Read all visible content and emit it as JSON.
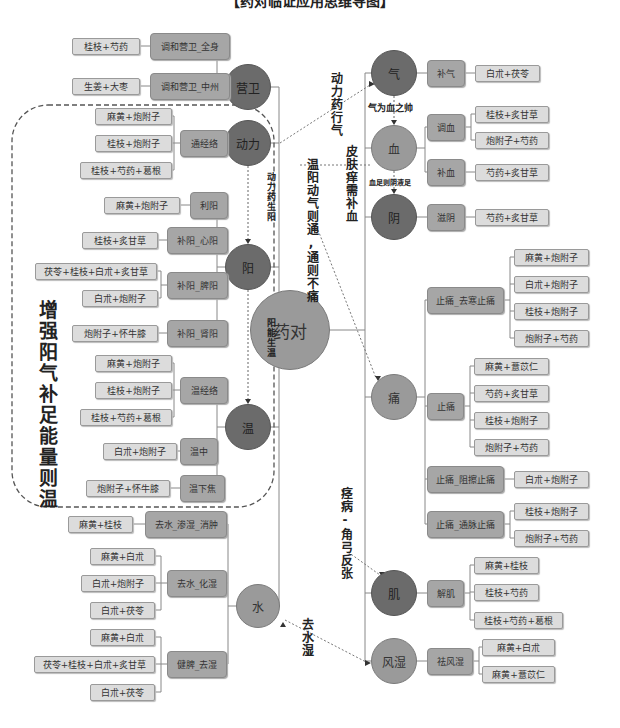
{
  "title": "【药对临证应用思维导图】",
  "center": {
    "label": "药对",
    "x": 290,
    "y": 330,
    "r": 40
  },
  "circles": [
    {
      "id": "yingwei",
      "label": "营卫",
      "x": 248,
      "y": 87,
      "r": 23,
      "tone": "dark"
    },
    {
      "id": "dongli",
      "label": "动力",
      "x": 248,
      "y": 143,
      "r": 23,
      "tone": "dark"
    },
    {
      "id": "yang",
      "label": "阳",
      "x": 248,
      "y": 267,
      "r": 23,
      "tone": "dark"
    },
    {
      "id": "wen",
      "label": "温",
      "x": 248,
      "y": 427,
      "r": 23,
      "tone": "dark"
    },
    {
      "id": "shui",
      "label": "水",
      "x": 258,
      "y": 606,
      "r": 22,
      "tone": "medium"
    },
    {
      "id": "qi",
      "label": "气",
      "x": 394,
      "y": 73,
      "r": 23,
      "tone": "dark"
    },
    {
      "id": "xue",
      "label": "血",
      "x": 394,
      "y": 148,
      "r": 23,
      "tone": "medium"
    },
    {
      "id": "yin",
      "label": "阴",
      "x": 394,
      "y": 217,
      "r": 23,
      "tone": "dark"
    },
    {
      "id": "tong",
      "label": "痛",
      "x": 394,
      "y": 397,
      "r": 23,
      "tone": "medium"
    },
    {
      "id": "ji",
      "label": "肌",
      "x": 394,
      "y": 593,
      "r": 23,
      "tone": "dark"
    },
    {
      "id": "fengshi",
      "label": "风湿",
      "x": 394,
      "y": 661,
      "r": 23,
      "tone": "medium"
    }
  ],
  "left_branches": [
    {
      "circle": "营卫",
      "mids": [
        {
          "label": "调和营卫_全身",
          "x": 150,
          "y": 46,
          "w": 80,
          "leaves": [
            {
              "label": "桂枝+芍药",
              "x": 72,
              "y": 46,
              "w": 68
            }
          ]
        },
        {
          "label": "调和营卫_中州",
          "x": 150,
          "y": 86,
          "w": 80,
          "leaves": [
            {
              "label": "生姜+大枣",
              "x": 72,
              "y": 86,
              "w": 68
            }
          ]
        }
      ]
    },
    {
      "circle": "动力",
      "mids": [
        {
          "label": "通经络",
          "x": 180,
          "y": 143,
          "w": 48,
          "leaves": [
            {
              "label": "麻黄+炮附子",
              "x": 95,
              "y": 116,
              "w": 77
            },
            {
              "label": "桂枝+炮附子",
              "x": 95,
              "y": 143,
              "w": 77
            },
            {
              "label": "桂枝+芍药+葛根",
              "x": 80,
              "y": 170,
              "w": 92
            }
          ]
        }
      ]
    },
    {
      "circle": "阳",
      "mids": [
        {
          "label": "利阳",
          "x": 190,
          "y": 205,
          "w": 38,
          "leaves": [
            {
              "label": "麻黄+炮附子",
              "x": 104,
              "y": 205,
              "w": 76
            }
          ]
        },
        {
          "label": "补阳_心阳",
          "x": 167,
          "y": 240,
          "w": 61,
          "leaves": [
            {
              "label": "桂枝+炙甘草",
              "x": 82,
              "y": 240,
              "w": 76
            }
          ]
        },
        {
          "label": "补阳_脾阳",
          "x": 167,
          "y": 285,
          "w": 61,
          "leaves": [
            {
              "label": "茯苓+桂枝+白朮+炙甘草",
              "x": 35,
              "y": 271,
              "w": 122
            },
            {
              "label": "白朮+炮附子",
              "x": 82,
              "y": 298,
              "w": 76
            }
          ]
        },
        {
          "label": "补阳_肾阳",
          "x": 167,
          "y": 333,
          "w": 61,
          "leaves": [
            {
              "label": "炮附子+怀牛膝",
              "x": 72,
              "y": 333,
              "w": 86
            }
          ]
        }
      ]
    },
    {
      "circle": "温",
      "mids": [
        {
          "label": "温经络",
          "x": 180,
          "y": 390,
          "w": 48,
          "leaves": [
            {
              "label": "麻黄+炮附子",
              "x": 95,
              "y": 363,
              "w": 77
            },
            {
              "label": "桂枝+炮附子",
              "x": 95,
              "y": 390,
              "w": 77
            },
            {
              "label": "桂枝+芍药+葛根",
              "x": 80,
              "y": 417,
              "w": 92
            }
          ]
        },
        {
          "label": "温中",
          "x": 180,
          "y": 451,
          "w": 38,
          "leaves": [
            {
              "label": "白朮+炮附子",
              "x": 103,
              "y": 451,
              "w": 74
            }
          ]
        },
        {
          "label": "温下焦",
          "x": 180,
          "y": 488,
          "w": 45,
          "leaves": [
            {
              "label": "炮附子+怀牛膝",
              "x": 86,
              "y": 488,
              "w": 84
            }
          ]
        }
      ]
    },
    {
      "circle": "水",
      "mids": [
        {
          "label": "去水_渗湿_消肿",
          "x": 145,
          "y": 524,
          "w": 82,
          "leaves": [
            {
              "label": "麻黄+桂枝",
              "x": 68,
              "y": 524,
              "w": 65
            }
          ]
        },
        {
          "label": "去水_化湿",
          "x": 167,
          "y": 583,
          "w": 60,
          "leaves": [
            {
              "label": "麻黄+白朮",
              "x": 90,
              "y": 556,
              "w": 65
            },
            {
              "label": "白朮+炮附子",
              "x": 81,
              "y": 583,
              "w": 74
            },
            {
              "label": "白朮+茯苓",
              "x": 90,
              "y": 610,
              "w": 65
            }
          ]
        },
        {
          "label": "健脾_去湿",
          "x": 167,
          "y": 664,
          "w": 60,
          "leaves": [
            {
              "label": "麻黄+白朮",
              "x": 90,
              "y": 637,
              "w": 65
            },
            {
              "label": "茯苓+桂枝+白朮+炙甘草",
              "x": 34,
              "y": 664,
              "w": 121
            },
            {
              "label": "白朮+茯苓",
              "x": 90,
              "y": 692,
              "w": 65
            }
          ]
        }
      ]
    }
  ],
  "right_branches": [
    {
      "circle": "气",
      "mids": [
        {
          "label": "补气",
          "x": 427,
          "y": 73,
          "w": 38,
          "leaves": [
            {
              "label": "白朮+茯苓",
              "x": 475,
              "y": 73,
              "w": 65
            }
          ]
        }
      ]
    },
    {
      "circle": "血",
      "mids": [
        {
          "label": "调血",
          "x": 427,
          "y": 127,
          "w": 38,
          "leaves": [
            {
              "label": "桂枝+炙甘草",
              "x": 475,
              "y": 114,
              "w": 74
            },
            {
              "label": "炮附子+芍药",
              "x": 475,
              "y": 140,
              "w": 74
            }
          ]
        },
        {
          "label": "补血",
          "x": 427,
          "y": 172,
          "w": 38,
          "leaves": [
            {
              "label": "芍药+炙甘草",
              "x": 475,
              "y": 172,
              "w": 74
            }
          ]
        }
      ]
    },
    {
      "circle": "阴",
      "mids": [
        {
          "label": "滋阴",
          "x": 427,
          "y": 217,
          "w": 38,
          "leaves": [
            {
              "label": "芍药+炙甘草",
              "x": 475,
              "y": 217,
              "w": 74
            }
          ]
        }
      ]
    },
    {
      "circle": "痛",
      "mids": [
        {
          "label": "止痛_去寒止痛",
          "x": 427,
          "y": 300,
          "w": 77,
          "leaves": [
            {
              "label": "麻黄+炮附子",
              "x": 514,
              "y": 257,
              "w": 75
            },
            {
              "label": "白朮+炮附子",
              "x": 514,
              "y": 284,
              "w": 75
            },
            {
              "label": "桂枝+炮附子",
              "x": 514,
              "y": 311,
              "w": 75
            },
            {
              "label": "炮附子+芍药",
              "x": 514,
              "y": 338,
              "w": 75
            }
          ]
        },
        {
          "label": "止痛",
          "x": 427,
          "y": 406,
          "w": 37,
          "leaves": [
            {
              "label": "麻黄+薏苡仁",
              "x": 474,
              "y": 366,
              "w": 75
            },
            {
              "label": "芍药+炙甘草",
              "x": 474,
              "y": 393,
              "w": 75
            },
            {
              "label": "桂枝+炮附子",
              "x": 474,
              "y": 420,
              "w": 75
            },
            {
              "label": "炮附子+芍药",
              "x": 474,
              "y": 447,
              "w": 75
            }
          ]
        },
        {
          "label": "止痛_阻擦止痛",
          "x": 427,
          "y": 479,
          "w": 77,
          "leaves": [
            {
              "label": "白朮+炮附子",
              "x": 514,
              "y": 479,
              "w": 75
            }
          ]
        },
        {
          "label": "止痛_通脉止痛",
          "x": 427,
          "y": 524,
          "w": 77,
          "leaves": [
            {
              "label": "桂枝+炮附子",
              "x": 514,
              "y": 511,
              "w": 75
            },
            {
              "label": "炮附子+芍药",
              "x": 514,
              "y": 538,
              "w": 75
            }
          ]
        }
      ]
    },
    {
      "circle": "肌",
      "mids": [
        {
          "label": "解肌",
          "x": 427,
          "y": 593,
          "w": 37,
          "leaves": [
            {
              "label": "麻黄+桂枝",
              "x": 474,
              "y": 565,
              "w": 65
            },
            {
              "label": "桂枝+芍药",
              "x": 474,
              "y": 592,
              "w": 65
            },
            {
              "label": "桂枝+芍药+葛根",
              "x": 474,
              "y": 620,
              "w": 89
            }
          ]
        }
      ]
    },
    {
      "circle": "风湿",
      "mids": [
        {
          "label": "祛风湿",
          "x": 427,
          "y": 661,
          "w": 46,
          "leaves": [
            {
              "label": "麻黄+白朮",
              "x": 482,
              "y": 647,
              "w": 73
            },
            {
              "label": "麻黄+薏苡仁",
              "x": 482,
              "y": 674,
              "w": 73
            }
          ]
        }
      ]
    }
  ],
  "annotations": {
    "big_label": "增强阳气补足能量则温",
    "dongli_to_yang": "动力药生阳",
    "yang_to_wen": "阳能生温",
    "dongli_to_qi": "动力药行气",
    "wenyang": "温阳动气则通,通则不痛",
    "pifu": "皮肤痒需补血",
    "qi_to_xue": "气为血之帅",
    "xue_to_yin": "血足则阴液足",
    "jing": "痉病-角弓反张",
    "qushui": "去水湿"
  }
}
